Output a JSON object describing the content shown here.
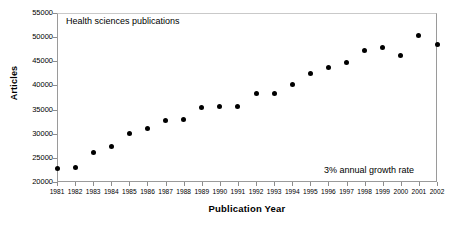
{
  "chart_data": {
    "type": "scatter",
    "title": "",
    "xlabel": "Publication Year",
    "ylabel": "Articles",
    "xlim": [
      1981,
      2002
    ],
    "ylim": [
      20000,
      55000
    ],
    "ytick_step": 5000,
    "grid": false,
    "legend": null,
    "annotations": [
      {
        "name": "series-label",
        "text": "Health sciences publications",
        "position": "top-left"
      },
      {
        "name": "growth-rate-note",
        "text": "3% annual growth rate",
        "position": "bottom-right"
      }
    ],
    "yticks": [
      20000,
      25000,
      30000,
      35000,
      40000,
      45000,
      50000,
      55000
    ],
    "ytick_labels": [
      "20000",
      "25000",
      "30000",
      "35000",
      "40000",
      "45000",
      "50000",
      "55000"
    ],
    "categories": [
      1981,
      1982,
      1983,
      1984,
      1985,
      1986,
      1987,
      1988,
      1989,
      1990,
      1991,
      1992,
      1993,
      1994,
      1995,
      1996,
      1997,
      1998,
      1999,
      2000,
      2001,
      2002
    ],
    "xtick_labels": [
      "1981",
      "1982",
      "1983",
      "1984",
      "1985",
      "1986",
      "1987",
      "1988",
      "1989",
      "1990",
      "1991",
      "1992",
      "1993",
      "1994",
      "1995",
      "1996",
      "1997",
      "1998",
      "1999",
      "2000",
      "2001",
      "2002"
    ],
    "values": [
      22700,
      23100,
      26200,
      27400,
      30100,
      31000,
      32700,
      32850,
      35400,
      35600,
      35600,
      38300,
      38300,
      40200,
      42400,
      43700,
      44800,
      47200,
      47900,
      46200,
      50300,
      48400
    ],
    "marker": {
      "shape": "circle",
      "color": "#000000",
      "size": 5
    },
    "series": [
      {
        "name": "Health sciences publications",
        "values": [
          22700,
          23100,
          26200,
          27400,
          30100,
          31000,
          32700,
          32850,
          35400,
          35600,
          35600,
          38300,
          38300,
          40200,
          42400,
          43700,
          44800,
          47200,
          47900,
          46200,
          50300,
          48400
        ]
      }
    ]
  },
  "colors": {
    "marker": "#000000",
    "axis": "#9a9a9a",
    "text": "#000000",
    "background": "#ffffff"
  }
}
